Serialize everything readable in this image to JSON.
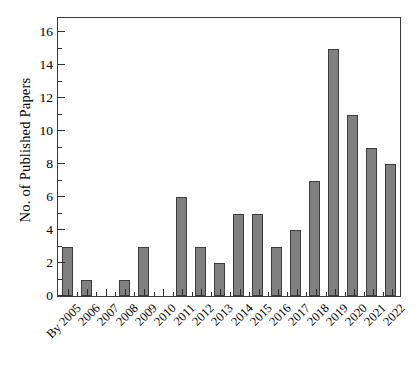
{
  "chart_data": {
    "type": "bar",
    "title": "",
    "xlabel": "",
    "ylabel": "No. of Published Papers",
    "categories": [
      "By 2005",
      "2006",
      "2007",
      "2008",
      "2009",
      "2010",
      "2011",
      "2012",
      "2013",
      "2014",
      "2015",
      "2016",
      "2017",
      "2018",
      "2019",
      "2020",
      "2021",
      "2022"
    ],
    "values": [
      3,
      1,
      0,
      1,
      3,
      0,
      6,
      3,
      2,
      5,
      5,
      3,
      4,
      7,
      15,
      11,
      9,
      8
    ],
    "ylim": [
      0,
      17
    ],
    "ytick_labels": [
      "0",
      "2",
      "4",
      "6",
      "8",
      "10",
      "12",
      "14",
      "16"
    ],
    "ytick_values": [
      0,
      2,
      4,
      6,
      8,
      10,
      12,
      14,
      16
    ],
    "yminor_values": [
      1,
      3,
      5,
      7,
      9,
      11,
      13,
      15
    ],
    "grid": false,
    "legend": null,
    "bar_color": "#808080",
    "bar_edge_color": "#3d3d3d",
    "axis_color": "#3a3a3a",
    "background": "#ffffff",
    "xtick_rotation": -45
  }
}
